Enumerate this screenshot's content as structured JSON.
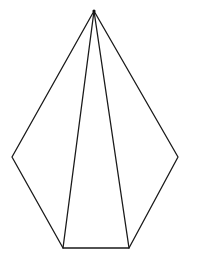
{
  "diagram": {
    "type": "geometric-figure",
    "canvas": {
      "width": 197,
      "height": 258
    },
    "colors": {
      "background": "#ffffff",
      "stroke": "#1a1a1a"
    },
    "vertices": [
      {
        "id": "apex",
        "x": 94,
        "y": 11
      },
      {
        "id": "right",
        "x": 178,
        "y": 157
      },
      {
        "id": "bottom-right",
        "x": 129,
        "y": 248
      },
      {
        "id": "bottom-left",
        "x": 63,
        "y": 248
      },
      {
        "id": "left",
        "x": 12,
        "y": 157
      }
    ],
    "outline": [
      "apex",
      "right",
      "bottom-right",
      "bottom-left",
      "left"
    ],
    "diagonals": [
      [
        "apex",
        "bottom-left"
      ],
      [
        "apex",
        "bottom-right"
      ]
    ],
    "labels": []
  }
}
